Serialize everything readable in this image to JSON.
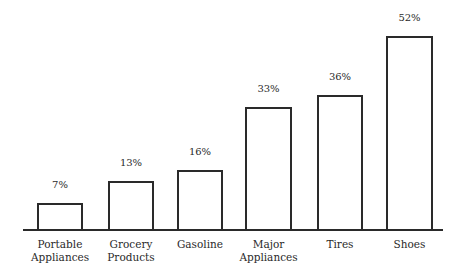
{
  "chart_data": {
    "type": "bar",
    "title": "",
    "xlabel": "",
    "ylabel": "",
    "categories": [
      "Portable Appliances",
      "Grocery Products",
      "Gasoline",
      "Major Appliances",
      "Tires",
      "Shoes"
    ],
    "values": [
      7,
      13,
      16,
      33,
      36,
      52
    ],
    "value_labels": [
      "7%",
      "13%",
      "16%",
      "33%",
      "36%",
      "52%"
    ],
    "unit": "%",
    "grid": false,
    "legend": null,
    "ylim": [
      0,
      55
    ]
  },
  "layout": {
    "baseline_y": 229,
    "px_per_unit": 3.71,
    "bars": [
      {
        "x": 37,
        "w": 46,
        "cat_lines": "Portable\nAppliances"
      },
      {
        "x": 108,
        "w": 46,
        "cat_lines": "Grocery\nProducts"
      },
      {
        "x": 177,
        "w": 46,
        "cat_lines": "Gasoline"
      },
      {
        "x": 245,
        "w": 47,
        "cat_lines": "Major\nAppliances"
      },
      {
        "x": 317,
        "w": 46,
        "cat_lines": "Tires"
      },
      {
        "x": 386,
        "w": 47,
        "cat_lines": "Shoes"
      }
    ]
  }
}
